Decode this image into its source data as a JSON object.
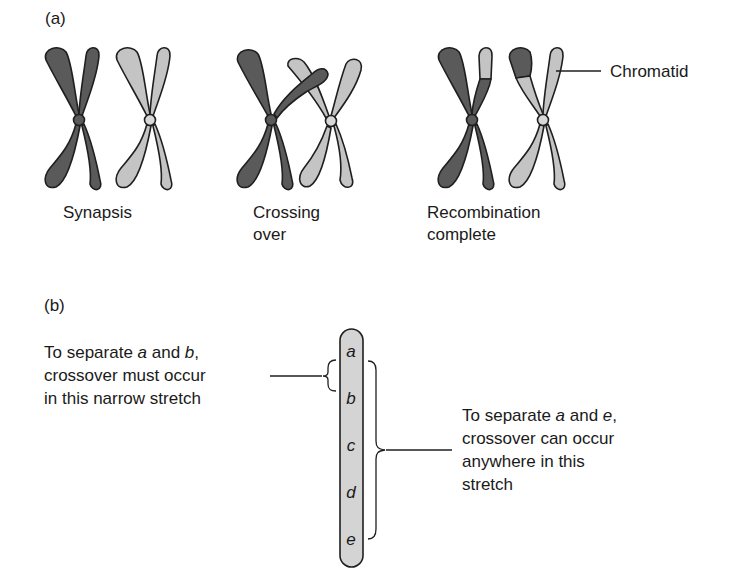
{
  "panel_a": {
    "label": "(a)",
    "stages": [
      {
        "caption_line1": "Synapsis",
        "caption_line2": ""
      },
      {
        "caption_line1": "Crossing",
        "caption_line2": "over"
      },
      {
        "caption_line1": "Recombination",
        "caption_line2": "complete"
      }
    ],
    "chromatid_label": "Chromatid",
    "colors": {
      "dark": "#5a5a5a",
      "light": "#c4c4c4",
      "outline": "#1f1f1f"
    }
  },
  "panel_b": {
    "label": "(b)",
    "genes": [
      "a",
      "b",
      "c",
      "d",
      "e"
    ],
    "left_note": {
      "line1_pre": "To separate ",
      "line1_g1": "a",
      "line1_mid": " and ",
      "line1_g2": "b",
      "line1_post": ",",
      "line2": "crossover must occur",
      "line3": "in this narrow stretch"
    },
    "right_note": {
      "line1_pre": "To separate ",
      "line1_g1": "a",
      "line1_mid": " and ",
      "line1_g2": "e",
      "line1_post": ",",
      "line2": "crossover can occur",
      "line3": "anywhere in this",
      "line4": "stretch"
    },
    "colors": {
      "bar_fill": "#d4d4d4",
      "outline": "#1f1f1f"
    }
  }
}
